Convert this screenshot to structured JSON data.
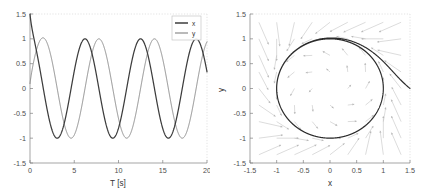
{
  "figure": {
    "background_color": "#ffffff",
    "panel_count": 2
  },
  "chart_data": [
    {
      "id": "time-series",
      "type": "line",
      "title": "",
      "xlabel": "T [s]",
      "ylabel": "",
      "xlim": [
        0,
        20
      ],
      "ylim": [
        -1.5,
        1.5
      ],
      "xticks": [
        0,
        5,
        10,
        15,
        20
      ],
      "xticklabels": [
        "0",
        "5",
        "10",
        "15",
        "20"
      ],
      "yticks": [
        -1.5,
        -1,
        -0.5,
        0,
        0.5,
        1,
        1.5
      ],
      "yticklabels": [
        "-1.5",
        "-1",
        "-0.5",
        "0",
        "0.5",
        "1",
        "1.5"
      ],
      "grid": false,
      "legend": {
        "position": "top-right",
        "entries": [
          {
            "label": "x",
            "color": "#3d3d3d"
          },
          {
            "label": "y",
            "color": "#8c8c8c"
          }
        ]
      },
      "series": [
        {
          "name": "x",
          "color": "#3d3d3d",
          "description": "Limit-cycle oscillator x(t); starts at 1.5, relaxes to unit amplitude cosine of period 6.28 s",
          "initial_value": 1.5,
          "steady_amplitude": 1.0,
          "period": 6.28,
          "phase_deg": 0
        },
        {
          "name": "y",
          "color": "#8c8c8c",
          "description": "Limit-cycle oscillator y(t); starts near 0.1, relaxes to unit amplitude sine of period 6.28 s",
          "initial_value": 0.1,
          "steady_amplitude": 1.0,
          "period": 6.28,
          "phase_deg": -90
        }
      ]
    },
    {
      "id": "phase-portrait",
      "type": "line",
      "title": "",
      "xlabel": "x",
      "ylabel": "y",
      "xlim": [
        -1.5,
        1.5
      ],
      "ylim": [
        -1.5,
        1.5
      ],
      "xticks": [
        -1.5,
        -1,
        -0.5,
        0,
        0.5,
        1,
        1.5
      ],
      "xticklabels": [
        "-1.5",
        "-1",
        "-0.5",
        "0",
        "0.5",
        "1",
        "1.5"
      ],
      "yticks": [
        -1.5,
        -1,
        -0.5,
        0,
        0.5,
        1,
        1.5
      ],
      "yticklabels": [
        "-1.5",
        "-1",
        "-0.5",
        "0",
        "0.5",
        "1",
        "1.5"
      ],
      "grid": false,
      "legend": null,
      "series": [
        {
          "name": "trajectory",
          "color": "#2b2b2b",
          "description": "Phase-plane trajectory starting at (1.5, 0) converging onto the unit-circle limit cycle",
          "start_point": [
            1.5,
            0.0
          ],
          "limit_cycle_radius": 1.0,
          "rotation": "counterclockwise"
        },
        {
          "name": "vector-field",
          "color": "#b8b8b8",
          "description": "Quiver field of the oscillator; arrows rotate counterclockwise and point toward the unit circle",
          "grid_nx": 9,
          "grid_ny": 9
        }
      ]
    }
  ]
}
